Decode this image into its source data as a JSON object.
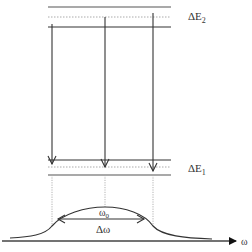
{
  "diagram": {
    "labels": {
      "upper_width": "ΔE",
      "upper_width_sub": "2",
      "lower_width": "ΔE",
      "lower_width_sub": "1",
      "center_frequency": "ω",
      "center_frequency_sub": "0",
      "linewidth": "Δω",
      "axis": "ω"
    },
    "upper_level": {
      "top_line_y": 7,
      "center_dotted_y": 17,
      "bottom_line_y": 27,
      "x_start": 48,
      "x_end": 171
    },
    "lower_level": {
      "top_line_y": 160,
      "center_dotted_y": 167,
      "bottom_line_y": 175,
      "x_start": 48,
      "x_end": 171
    },
    "transitions": [
      {
        "x": 52,
        "y_start": 24,
        "y_end": 164
      },
      {
        "x": 105,
        "y_start": 17,
        "y_end": 167
      },
      {
        "x": 153,
        "y_start": 13,
        "y_end": 171
      }
    ],
    "colors": {
      "line": "#333333",
      "dotted": "#999999"
    }
  }
}
